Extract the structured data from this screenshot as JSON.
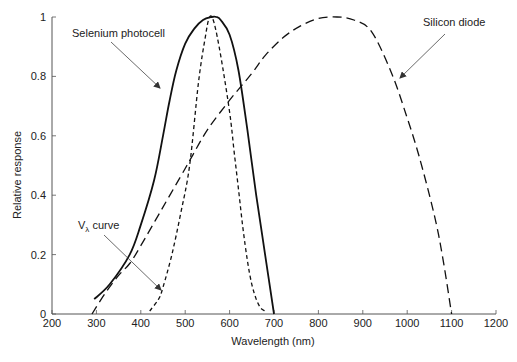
{
  "chart_data": {
    "type": "line",
    "title": "",
    "xlabel": "Wavelength (nm)",
    "ylabel": "Relative response",
    "xlim": [
      200,
      1200
    ],
    "ylim": [
      0,
      1
    ],
    "grid": false,
    "legend": "none (inline annotations with arrows)",
    "x_ticks": [
      200,
      300,
      400,
      500,
      600,
      700,
      800,
      900,
      1000,
      1100,
      1200
    ],
    "y_ticks": [
      0,
      0.2,
      0.4,
      0.6,
      0.8,
      1
    ],
    "x_tick_labels": [
      "200",
      "300",
      "400",
      "500",
      "600",
      "700",
      "800",
      "900",
      "1000",
      "1100",
      "1200"
    ],
    "y_tick_labels": [
      "0",
      "0.2",
      "0.4",
      "0.6",
      "0.8",
      "1"
    ],
    "series": [
      {
        "name": "Selenium photocell",
        "style": "solid",
        "x": [
          295,
          330,
          375,
          400,
          430,
          450,
          465,
          480,
          500,
          520,
          540,
          560,
          570,
          580,
          600,
          620,
          640,
          660,
          680,
          700
        ],
        "y": [
          0.05,
          0.1,
          0.2,
          0.3,
          0.45,
          0.6,
          0.72,
          0.82,
          0.91,
          0.96,
          0.99,
          1.0,
          1.0,
          0.99,
          0.94,
          0.82,
          0.62,
          0.4,
          0.2,
          0.0
        ]
      },
      {
        "name": "Vλ curve",
        "style": "short-dash",
        "x": [
          420,
          440,
          450,
          470,
          490,
          510,
          530,
          545,
          555,
          565,
          580,
          600,
          610,
          620,
          630,
          640,
          650,
          660,
          670,
          680
        ],
        "y": [
          0.01,
          0.05,
          0.09,
          0.2,
          0.34,
          0.5,
          0.78,
          0.93,
          1.0,
          0.98,
          0.87,
          0.68,
          0.55,
          0.42,
          0.29,
          0.18,
          0.1,
          0.05,
          0.02,
          0.01
        ]
      },
      {
        "name": "Silicon diode",
        "style": "long-dash",
        "x": [
          290,
          320,
          350,
          375,
          400,
          450,
          500,
          515,
          550,
          600,
          650,
          680,
          720,
          760,
          800,
          842,
          880,
          920,
          965,
          1000,
          1027,
          1060,
          1080,
          1100
        ],
        "y": [
          0.0,
          0.07,
          0.13,
          0.17,
          0.23,
          0.36,
          0.49,
          0.53,
          0.62,
          0.72,
          0.81,
          0.87,
          0.93,
          0.97,
          0.995,
          1.0,
          0.99,
          0.95,
          0.81,
          0.66,
          0.53,
          0.34,
          0.19,
          0.0
        ]
      }
    ],
    "annotations": [
      {
        "text": "Selenium photocell",
        "target_series": "Selenium photocell"
      },
      {
        "text": "Silicon diode",
        "target_series": "Silicon diode"
      },
      {
        "text_main": "V",
        "text_sub": "λ",
        "text_rest": " curve",
        "target_series": "Vλ curve"
      }
    ]
  },
  "labels": {
    "xlabel": "Wavelength (nm)",
    "ylabel": "Relative response",
    "selenium": "Selenium photocell",
    "silicon": "Silicon diode",
    "vlambda_main": "V",
    "vlambda_sub": "λ",
    "vlambda_rest": " curve"
  }
}
